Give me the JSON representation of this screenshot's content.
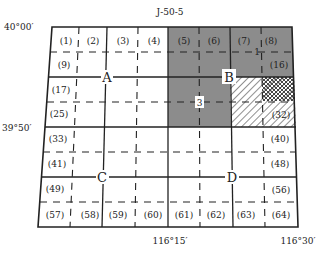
{
  "title": "J-50-5",
  "lat_labels": {
    "top": "40°00′",
    "middle": "39°50′"
  },
  "lon_labels": {
    "middle": "116°15′",
    "right": "116°30′"
  },
  "quadrants": [
    "A",
    "B",
    "C",
    "D"
  ],
  "marker_3": "3",
  "marker_1": "1",
  "cells": {
    "c1": "(1)",
    "c2": "(2)",
    "c3": "(3)",
    "c4": "(4)",
    "c5": "(5)",
    "c6": "(6)",
    "c7": "(7)",
    "c8": "(8)",
    "c9": "(9)",
    "c16": "(16)",
    "c17": "(17)",
    "c25": "(25)",
    "c32": "(32)",
    "c33": "(33)",
    "c40": "(40)",
    "c41": "(41)",
    "c48": "(48)",
    "c49": "(49)",
    "c56": "(56)",
    "c57": "(57)",
    "c58": "(58)",
    "c59": "(59)",
    "c60": "(60)",
    "c61": "(61)",
    "c62": "(62)",
    "c63": "(63)",
    "c64": "(64)"
  },
  "colors": {
    "shade": "#8c8c8c",
    "line": "#222222",
    "hatch": "#444444"
  }
}
